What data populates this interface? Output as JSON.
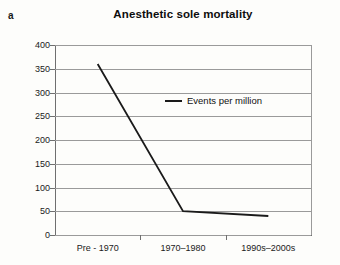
{
  "panel": {
    "label": "a"
  },
  "chart_data": {
    "type": "line",
    "title": "Anesthetic sole mortality",
    "xlabel": "",
    "ylabel": "",
    "categories": [
      "Pre - 1970",
      "1970–1980",
      "1990s–2000s"
    ],
    "series": [
      {
        "name": "Events per million",
        "values": [
          360,
          50,
          40
        ]
      }
    ],
    "legend": {
      "position": "inside-center",
      "entries": [
        "Events per million"
      ]
    },
    "ylim": [
      0,
      400
    ],
    "yticks": [
      0,
      50,
      100,
      150,
      200,
      250,
      300,
      350,
      400
    ],
    "ytick_labels": [
      "0",
      "50",
      "100",
      "150",
      "200",
      "250",
      "300",
      "350",
      "400"
    ],
    "grid": true,
    "line_color": "#1a1a1a"
  }
}
